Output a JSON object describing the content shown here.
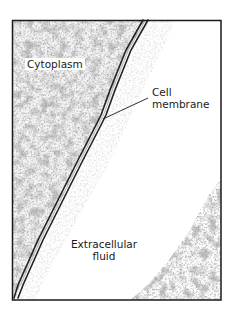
{
  "figure": {
    "type": "electron-micrograph-diagram",
    "frame": {
      "x": 12,
      "y": 20,
      "width": 209,
      "height": 280,
      "stroke_color": "#1a1a1a"
    },
    "labels": {
      "cytoplasm": "Cytoplasm",
      "cell_membrane_line1": "Cell",
      "cell_membrane_line2": "membrane",
      "extracellular_line1": "Extracellular",
      "extracellular_line2": "fluid"
    },
    "colors": {
      "background": "#ffffff",
      "texture": "#6a6a6a",
      "membrane": "#222222",
      "text": "#1a1a1a"
    }
  }
}
